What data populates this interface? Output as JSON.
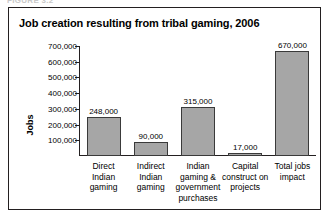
{
  "caption_strip": "FIGURE 3.2",
  "figure": {
    "title": "Job creation resulting from tribal gaming, 2006"
  },
  "chart_data": {
    "type": "bar",
    "title": "Job creation resulting from tribal gaming, 2006",
    "xlabel": "",
    "ylabel": "Jobs",
    "ylim": [
      0,
      700000
    ],
    "grid": false,
    "legend": "none",
    "ytick_labels": [
      "100,000",
      "200,000",
      "300,000",
      "400,000",
      "500,000",
      "600,000",
      "700,000"
    ],
    "ytick_values": [
      100000,
      200000,
      300000,
      400000,
      500000,
      600000,
      700000
    ],
    "categories": [
      "Direct Indian gaming",
      "Indirect Indian gaming",
      "Indian gaming & government purchases",
      "Capital construct on projects",
      "Total jobs impact"
    ],
    "category_lines": [
      [
        "Direct",
        "Indian",
        "gaming"
      ],
      [
        "Indirect",
        "Indian",
        "gaming"
      ],
      [
        "Indian",
        "gaming &",
        "government",
        "purchases"
      ],
      [
        "Capital",
        "construct on",
        "projects"
      ],
      [
        "Total jobs",
        "impact"
      ]
    ],
    "values": [
      248000,
      90000,
      315000,
      17000,
      670000
    ],
    "value_labels": [
      "248,000",
      "90,000",
      "315,000",
      "17,000",
      "670,000"
    ],
    "bar_color": "#a6a6a6",
    "bar_edge_color": "#3a3a3a"
  }
}
